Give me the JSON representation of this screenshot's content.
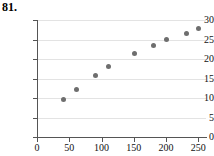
{
  "problem": {
    "number": "81."
  },
  "chart_data": {
    "type": "scatter",
    "title": "",
    "xlabel": "",
    "ylabel": "",
    "xlim": [
      0,
      262
    ],
    "ylim": [
      0,
      30
    ],
    "xticks": [
      0,
      50,
      100,
      150,
      200,
      250
    ],
    "xticklabels": [
      "0",
      "50",
      "100",
      "150",
      "200",
      "250"
    ],
    "yticks": [
      0,
      5,
      10,
      15,
      20,
      25,
      30
    ],
    "yticklabels": [
      "0",
      "5",
      "10",
      "15",
      "20",
      "25",
      "30"
    ],
    "grid": "horizontal",
    "legend": "none",
    "marker_color": "#6e6e6e",
    "series": [
      {
        "name": "data",
        "points": [
          {
            "x": 41,
            "y": 9.6
          },
          {
            "x": 61,
            "y": 12.3
          },
          {
            "x": 91,
            "y": 15.7
          },
          {
            "x": 111,
            "y": 18.0
          },
          {
            "x": 151,
            "y": 21.5
          },
          {
            "x": 181,
            "y": 23.5
          },
          {
            "x": 201,
            "y": 25.0
          },
          {
            "x": 231,
            "y": 26.6
          },
          {
            "x": 251,
            "y": 27.8
          }
        ]
      }
    ]
  }
}
